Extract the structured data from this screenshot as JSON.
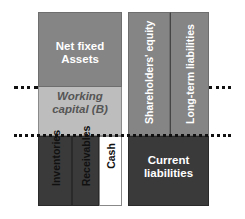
{
  "diagram": {
    "left_column": {
      "net_fixed_assets": {
        "label_line1": "Net fixed",
        "label_line2": "Assets",
        "color": "#858585"
      },
      "working_capital": {
        "label_line1": "Working",
        "label_line2": "capital (B)",
        "color": "#bdbdbd"
      },
      "inventories": {
        "label": "Inventories",
        "color": "#3a3a3a"
      },
      "receivables": {
        "label": "Receivables",
        "color": "#3a3a3a"
      },
      "cash": {
        "label": "Cash",
        "color": "#ffffff"
      }
    },
    "right_column": {
      "shareholders_equity": {
        "label": "Shareholders' equity",
        "color": "#858585"
      },
      "long_term_liabilities": {
        "label": "Long-term liabilities",
        "color": "#858585"
      },
      "current_liabilities": {
        "label_line1": "Current",
        "label_line2": "liabilities",
        "color": "#3a3a3a"
      }
    },
    "dotted_lines": [
      "upper",
      "lower"
    ]
  }
}
